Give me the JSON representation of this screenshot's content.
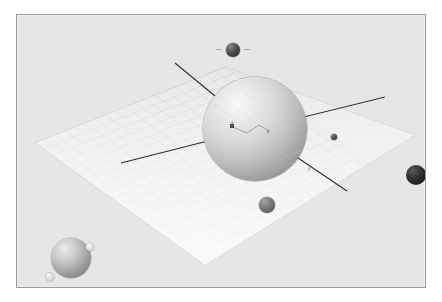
{
  "scene": {
    "title": "3D orbital scene viewport",
    "background_color": "#ffffff",
    "plane_color": "#e9e9e9",
    "border_color": "#9a9a9a",
    "grid_color": "#b9b9b9",
    "axis_color": "#2f2f2f"
  },
  "axis_labels": {
    "z": "z",
    "x": "x",
    "y": "y"
  },
  "bodies": [
    {
      "name": "main-planet",
      "label": "",
      "shade": "light",
      "cx": 238,
      "cy": 114,
      "r": 52
    },
    {
      "name": "planet-lower-left",
      "label": "",
      "shade": "light",
      "cx": 54,
      "cy": 243,
      "r": 20
    },
    {
      "name": "small-body-top",
      "label": "",
      "shade": "dark",
      "cx": 216,
      "cy": 35,
      "r": 7
    },
    {
      "name": "small-body-lower-center",
      "label": "",
      "shade": "mid",
      "cx": 250,
      "cy": 190,
      "r": 8
    },
    {
      "name": "small-body-right-edge",
      "label": "",
      "shade": "verydark",
      "cx": 399,
      "cy": 160,
      "r": 10
    },
    {
      "name": "dot-body-right-of-planet",
      "label": "",
      "shade": "dark",
      "cx": 317,
      "cy": 122,
      "r": 3
    }
  ],
  "moons": [
    {
      "name": "moon-upper-right",
      "cx": 73,
      "cy": 232,
      "r": 4
    },
    {
      "name": "moon-lower-left",
      "cx": 33,
      "cy": 262,
      "r": 4
    }
  ]
}
